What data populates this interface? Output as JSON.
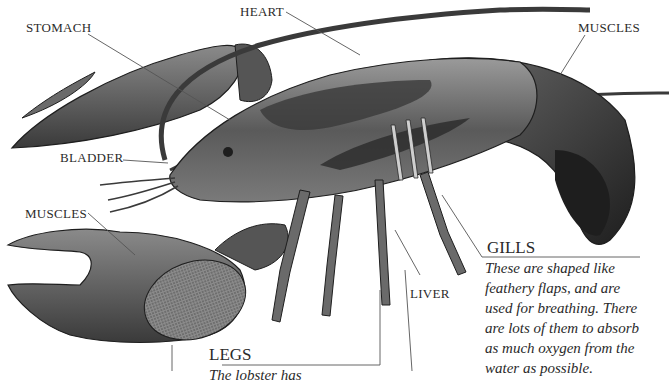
{
  "diagram": {
    "labels": {
      "stomach": "STOMACH",
      "heart": "HEART",
      "muscles_tail": "MUSCLES",
      "bladder": "BLADDER",
      "muscles_claw": "MUSCLES",
      "liver": "LIVER"
    },
    "callouts": {
      "gills": {
        "title": "GILLS",
        "text_lines": [
          "These are shaped like",
          "feathery flaps, and are",
          "used for breathing. There",
          "are lots of them to absorb",
          "as much oxygen from the",
          "water as possible."
        ]
      },
      "legs": {
        "title": "LEGS",
        "text_partial": "The lobster has"
      }
    },
    "colors": {
      "background": "#ffffff",
      "ink": "#2a2a2a",
      "shell_dark": "#3a3a3a",
      "shell_mid": "#6e6e6e",
      "shell_light": "#a8a8a8",
      "leader_line": "#555555"
    }
  }
}
